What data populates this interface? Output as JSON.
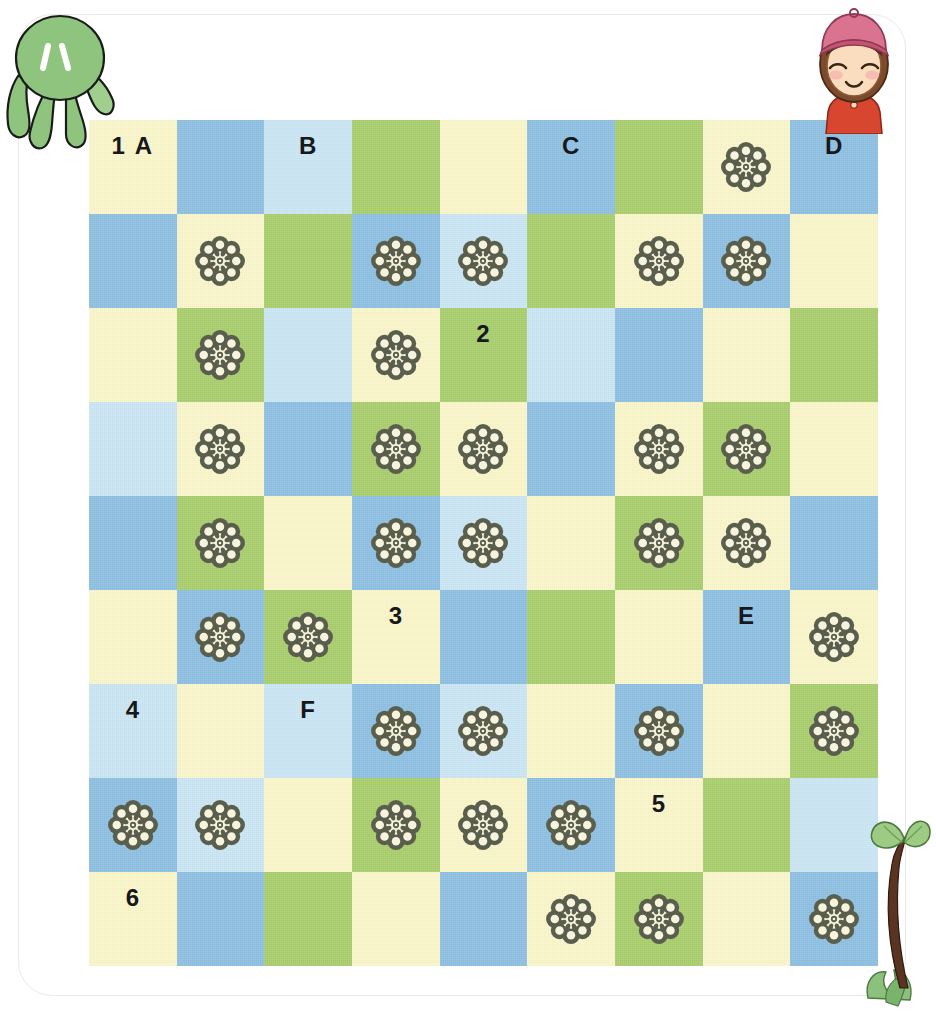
{
  "page": {
    "colors": {
      "cream": "#faf6c9",
      "blue": "#8dbfe2",
      "lightblue": "#c9e6f3",
      "green": "#a9cd6c",
      "flower": "#5a5e4d",
      "label_text": "#17171c",
      "sheet_background": "#ffffff"
    }
  },
  "decorations": [
    {
      "name": "octopus-character",
      "description": "green octopus with two white eye marks",
      "color": "#8fc47e"
    },
    {
      "name": "girl-character",
      "description": "girl with pink cap, brown hair, closed eyes, red shirt",
      "color": "#e2738f"
    },
    {
      "name": "sprout-plant",
      "description": "brown stem with two heart shaped green leaves",
      "color": "#6f3f2a"
    }
  ],
  "grid": {
    "columns": 9,
    "rows": 9,
    "cells": [
      [
        {
          "color": "cream",
          "label": "1 A",
          "flower": false
        },
        {
          "color": "blue",
          "label": "",
          "flower": false
        },
        {
          "color": "lightblue",
          "label": "B",
          "flower": false
        },
        {
          "color": "green",
          "label": "",
          "flower": false
        },
        {
          "color": "cream",
          "label": "",
          "flower": false
        },
        {
          "color": "blue",
          "label": "C",
          "flower": false
        },
        {
          "color": "green",
          "label": "",
          "flower": false
        },
        {
          "color": "cream",
          "label": "",
          "flower": true
        },
        {
          "color": "blue",
          "label": "D",
          "flower": false
        }
      ],
      [
        {
          "color": "blue",
          "label": "",
          "flower": false
        },
        {
          "color": "cream",
          "label": "",
          "flower": true
        },
        {
          "color": "green",
          "label": "",
          "flower": false
        },
        {
          "color": "blue",
          "label": "",
          "flower": true
        },
        {
          "color": "lightblue",
          "label": "",
          "flower": true
        },
        {
          "color": "green",
          "label": "",
          "flower": false
        },
        {
          "color": "cream",
          "label": "",
          "flower": true
        },
        {
          "color": "blue",
          "label": "",
          "flower": true
        },
        {
          "color": "cream",
          "label": "",
          "flower": false
        }
      ],
      [
        {
          "color": "cream",
          "label": "",
          "flower": false
        },
        {
          "color": "green",
          "label": "",
          "flower": true
        },
        {
          "color": "lightblue",
          "label": "",
          "flower": false
        },
        {
          "color": "cream",
          "label": "",
          "flower": true
        },
        {
          "color": "green",
          "label": "2",
          "flower": false
        },
        {
          "color": "lightblue",
          "label": "",
          "flower": false
        },
        {
          "color": "blue",
          "label": "",
          "flower": false
        },
        {
          "color": "cream",
          "label": "",
          "flower": false
        },
        {
          "color": "green",
          "label": "",
          "flower": false
        }
      ],
      [
        {
          "color": "lightblue",
          "label": "",
          "flower": false
        },
        {
          "color": "cream",
          "label": "",
          "flower": true
        },
        {
          "color": "blue",
          "label": "",
          "flower": false
        },
        {
          "color": "green",
          "label": "",
          "flower": true
        },
        {
          "color": "cream",
          "label": "",
          "flower": true
        },
        {
          "color": "blue",
          "label": "",
          "flower": false
        },
        {
          "color": "cream",
          "label": "",
          "flower": true
        },
        {
          "color": "green",
          "label": "",
          "flower": true
        },
        {
          "color": "cream",
          "label": "",
          "flower": false
        }
      ],
      [
        {
          "color": "blue",
          "label": "",
          "flower": false
        },
        {
          "color": "green",
          "label": "",
          "flower": true
        },
        {
          "color": "cream",
          "label": "",
          "flower": false
        },
        {
          "color": "blue",
          "label": "",
          "flower": true
        },
        {
          "color": "lightblue",
          "label": "",
          "flower": true
        },
        {
          "color": "cream",
          "label": "",
          "flower": false
        },
        {
          "color": "green",
          "label": "",
          "flower": true
        },
        {
          "color": "cream",
          "label": "",
          "flower": true
        },
        {
          "color": "blue",
          "label": "",
          "flower": false
        }
      ],
      [
        {
          "color": "cream",
          "label": "",
          "flower": false
        },
        {
          "color": "blue",
          "label": "",
          "flower": true
        },
        {
          "color": "green",
          "label": "",
          "flower": true
        },
        {
          "color": "cream",
          "label": "3",
          "flower": false
        },
        {
          "color": "blue",
          "label": "",
          "flower": false
        },
        {
          "color": "green",
          "label": "",
          "flower": false
        },
        {
          "color": "cream",
          "label": "",
          "flower": false
        },
        {
          "color": "blue",
          "label": "E",
          "flower": false
        },
        {
          "color": "cream",
          "label": "",
          "flower": true
        }
      ],
      [
        {
          "color": "lightblue",
          "label": "4",
          "flower": false
        },
        {
          "color": "cream",
          "label": "",
          "flower": false
        },
        {
          "color": "lightblue",
          "label": "F",
          "flower": false
        },
        {
          "color": "blue",
          "label": "",
          "flower": true
        },
        {
          "color": "lightblue",
          "label": "",
          "flower": true
        },
        {
          "color": "cream",
          "label": "",
          "flower": false
        },
        {
          "color": "blue",
          "label": "",
          "flower": true
        },
        {
          "color": "cream",
          "label": "",
          "flower": false
        },
        {
          "color": "green",
          "label": "",
          "flower": true
        }
      ],
      [
        {
          "color": "blue",
          "label": "",
          "flower": true
        },
        {
          "color": "lightblue",
          "label": "",
          "flower": true
        },
        {
          "color": "cream",
          "label": "",
          "flower": false
        },
        {
          "color": "green",
          "label": "",
          "flower": true
        },
        {
          "color": "cream",
          "label": "",
          "flower": true
        },
        {
          "color": "blue",
          "label": "",
          "flower": true
        },
        {
          "color": "cream",
          "label": "5",
          "flower": false
        },
        {
          "color": "green",
          "label": "",
          "flower": false
        },
        {
          "color": "lightblue",
          "label": "",
          "flower": false
        }
      ],
      [
        {
          "color": "cream",
          "label": "6",
          "flower": false
        },
        {
          "color": "blue",
          "label": "",
          "flower": false
        },
        {
          "color": "green",
          "label": "",
          "flower": false
        },
        {
          "color": "cream",
          "label": "",
          "flower": false
        },
        {
          "color": "blue",
          "label": "",
          "flower": false
        },
        {
          "color": "cream",
          "label": "",
          "flower": true
        },
        {
          "color": "green",
          "label": "",
          "flower": true
        },
        {
          "color": "cream",
          "label": "",
          "flower": false
        },
        {
          "color": "blue",
          "label": "",
          "flower": true
        }
      ]
    ]
  }
}
